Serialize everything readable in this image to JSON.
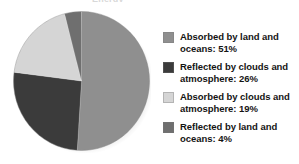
{
  "figure": {
    "title_remnant": "Energy",
    "background": "#ffffff"
  },
  "chart_data": {
    "type": "pie",
    "title": "",
    "xlabel": "",
    "ylabel": "",
    "start_angle_deg": 0,
    "direction": "clockwise",
    "legend_position": "right",
    "grid": false,
    "categories": [
      "Absorbed by land and oceans",
      "Reflected by clouds and atmosphere",
      "Absorbed by clouds and atmosphere",
      "Reflected by land and oceans"
    ],
    "values": [
      51,
      26,
      19,
      4
    ],
    "units": "%",
    "colors": [
      "#8f8f8f",
      "#3b3b3b",
      "#d5d5d5",
      "#6f6f6f"
    ],
    "labels": [
      "Absorbed by land and oceans: 51%",
      "Reflected by clouds and atmosphere: 26%",
      "Absorbed by clouds and atmosphere: 19%",
      "Reflected by land and oceans: 4%"
    ]
  },
  "legend": {
    "items": [
      {
        "label": "Absorbed by land and oceans: 51%",
        "color": "#8f8f8f"
      },
      {
        "label": "Reflected by clouds and atmosphere: 26%",
        "color": "#3b3b3b"
      },
      {
        "label": "Absorbed by clouds and atmosphere: 19%",
        "color": "#d5d5d5"
      },
      {
        "label": "Reflected by land and oceans: 4%",
        "color": "#6f6f6f"
      }
    ]
  }
}
